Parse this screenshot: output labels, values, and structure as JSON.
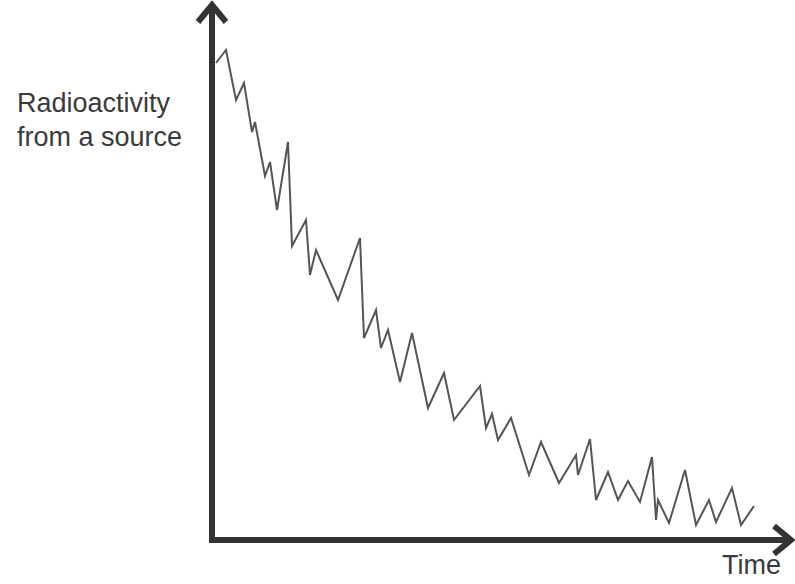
{
  "chart_data": {
    "type": "line",
    "title": "",
    "xlabel": "Time",
    "ylabel_lines": [
      "Radioactivity",
      "from a source"
    ],
    "ylabel": "Radioactivity from a source",
    "grid": false,
    "legend": null,
    "axes": {
      "x_ticks": [],
      "y_ticks": [],
      "arrowheads": true
    },
    "units": "pixel-space coordinates (x right, y down)",
    "series": [
      {
        "name": "radioactivity",
        "color": "#555555",
        "points": [
          [
            216,
            63
          ],
          [
            226,
            50
          ],
          [
            236,
            100
          ],
          [
            244,
            83
          ],
          [
            252,
            132
          ],
          [
            255,
            122
          ],
          [
            265,
            176
          ],
          [
            270,
            162
          ],
          [
            277,
            210
          ],
          [
            288,
            142
          ],
          [
            292,
            246
          ],
          [
            306,
            220
          ],
          [
            310,
            275
          ],
          [
            316,
            250
          ],
          [
            338,
            300
          ],
          [
            360,
            238
          ],
          [
            364,
            338
          ],
          [
            376,
            310
          ],
          [
            381,
            348
          ],
          [
            388,
            330
          ],
          [
            400,
            382
          ],
          [
            412,
            333
          ],
          [
            428,
            408
          ],
          [
            444,
            373
          ],
          [
            454,
            420
          ],
          [
            480,
            386
          ],
          [
            486,
            428
          ],
          [
            492,
            414
          ],
          [
            498,
            440
          ],
          [
            511,
            418
          ],
          [
            529,
            475
          ],
          [
            541,
            442
          ],
          [
            559,
            483
          ],
          [
            576,
            455
          ],
          [
            578,
            475
          ],
          [
            590,
            439
          ],
          [
            596,
            500
          ],
          [
            608,
            472
          ],
          [
            618,
            500
          ],
          [
            628,
            481
          ],
          [
            640,
            502
          ],
          [
            652,
            457
          ],
          [
            656,
            520
          ],
          [
            658,
            500
          ],
          [
            669,
            523
          ],
          [
            685,
            470
          ],
          [
            696,
            525
          ],
          [
            709,
            500
          ],
          [
            716,
            522
          ],
          [
            732,
            488
          ],
          [
            741,
            525
          ],
          [
            754,
            506
          ]
        ]
      }
    ],
    "colors": {
      "axis": "#333333",
      "line": "#555555",
      "text": "#3a3a3a"
    }
  }
}
